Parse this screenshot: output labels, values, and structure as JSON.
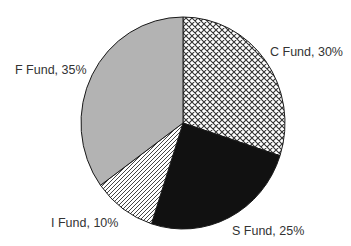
{
  "chart_data": {
    "type": "pie",
    "title": "",
    "categories": [
      "C Fund",
      "S Fund",
      "I Fund",
      "F Fund"
    ],
    "values": [
      30,
      25,
      10,
      35
    ],
    "unit": "%",
    "start_angle": "12 o'clock, clockwise",
    "legend": "none (data labels)",
    "slices": [
      {
        "name": "C Fund",
        "value": 30,
        "label": "C Fund, 30%",
        "fill": "crosshatch",
        "color": "#ffffff"
      },
      {
        "name": "S Fund",
        "value": 25,
        "label": "S Fund, 25%",
        "fill": "solid",
        "color": "#111111"
      },
      {
        "name": "I Fund",
        "value": 10,
        "label": "I Fund, 10%",
        "fill": "diagonal-lines",
        "color": "#ffffff"
      },
      {
        "name": "F Fund",
        "value": 35,
        "label": "F Fund, 35%",
        "fill": "solid",
        "color": "#b3b3b3"
      }
    ]
  },
  "labels": {
    "c": "C Fund, 30%",
    "s": "S Fund, 25%",
    "i": "I Fund, 10%",
    "f": "F Fund, 35%"
  }
}
